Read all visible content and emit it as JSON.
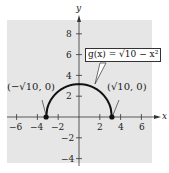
{
  "chart_data": {
    "type": "line",
    "title": "",
    "function_label": "g(x) = √(10 − x²)",
    "xlabel": "x",
    "ylabel": "y",
    "xlim": [
      -7,
      7
    ],
    "ylim": [
      -5,
      9
    ],
    "xticks": [
      -6,
      -4,
      -2,
      2,
      4,
      6
    ],
    "yticks": [
      8,
      6,
      4,
      2,
      -2,
      -4
    ],
    "xtick_labels": [
      "−6",
      "−4",
      "−2",
      "2",
      "4",
      "6"
    ],
    "ytick_labels": [
      "8",
      "6",
      "4",
      "2",
      "−2",
      "−4"
    ],
    "grid": false,
    "background": "#e8e8e8",
    "series": [
      {
        "name": "g(x) = √(10 − x²)",
        "domain": [
          -3.1623,
          3.1623
        ],
        "x": [
          -3.1623,
          -3,
          -2.5,
          -2,
          -1.5,
          -1,
          -0.5,
          0,
          0.5,
          1,
          1.5,
          2,
          2.5,
          3,
          3.1623
        ],
        "y": [
          0,
          1,
          1.94,
          2.45,
          2.78,
          3,
          3.12,
          3.16,
          3.12,
          3,
          2.78,
          2.45,
          1.94,
          1,
          0
        ]
      }
    ],
    "points": [
      {
        "x": -3.1623,
        "y": 0,
        "label": "(−√10, 0)"
      },
      {
        "x": 3.1623,
        "y": 0,
        "label": "(√10, 0)"
      }
    ]
  },
  "labels": {
    "x_axis": "x",
    "y_axis": "y",
    "callout": "g(x) = √10 − x²",
    "left_point": "(−√10, 0)",
    "right_point": "(√10, 0)",
    "tick_x": [
      "−6",
      "−4",
      "−2",
      "2",
      "4",
      "6"
    ],
    "tick_y": [
      "8",
      "6",
      "4",
      "2",
      "−2",
      "−4"
    ]
  }
}
